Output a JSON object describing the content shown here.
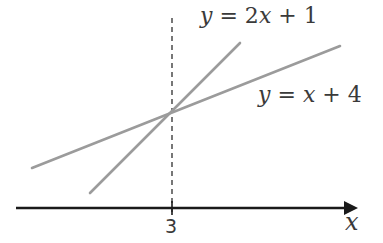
{
  "diagram": {
    "type": "line-intersection",
    "colors": {
      "line": "#9b9b9b",
      "axis": "#1a1a1a",
      "text": "#3a3a3a",
      "dashed": "#555555"
    },
    "lines": [
      {
        "name": "line-2x-plus-1",
        "label_y": "y",
        "label_eq": "= 2",
        "label_x": "x",
        "label_rest": "+ 1",
        "equation": "y = 2x + 1",
        "start": [
          90,
          193
        ],
        "end": [
          240,
          43
        ]
      },
      {
        "name": "line-x-plus-4",
        "label_y": "y",
        "label_eq": "=",
        "label_x": "x",
        "label_rest": "+ 4",
        "equation": "y = x + 4",
        "start": [
          32,
          168
        ],
        "end": [
          340,
          46
        ]
      }
    ],
    "intersection": {
      "x_value": "3",
      "px": 172
    },
    "axis": {
      "label": "x",
      "tick_label": "3"
    }
  }
}
